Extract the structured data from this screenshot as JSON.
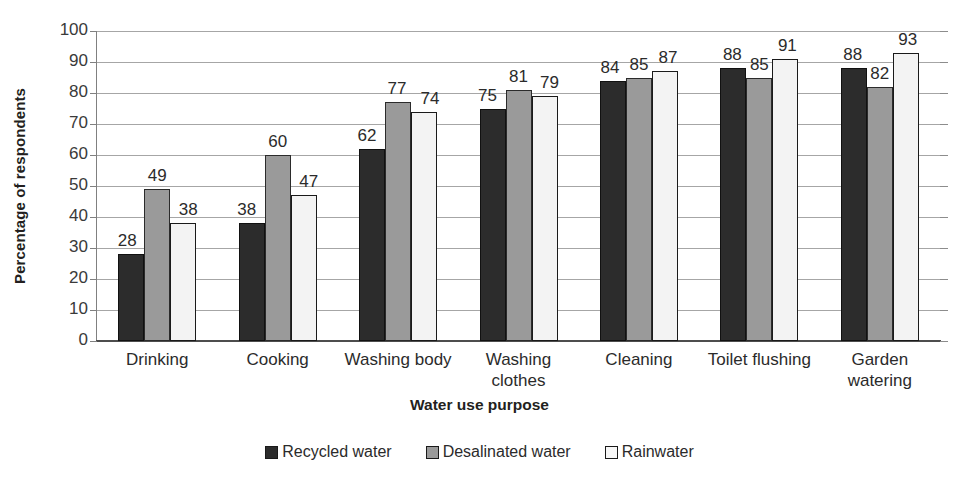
{
  "chart_data": {
    "type": "bar",
    "title": "",
    "xlabel": "Water use purpose",
    "ylabel": "Percentage of respondents",
    "ylim": [
      0,
      100
    ],
    "ytick_step": 10,
    "yticks": [
      100,
      90,
      80,
      70,
      60,
      50,
      40,
      30,
      20,
      10,
      0
    ],
    "grid": true,
    "legend_position": "bottom",
    "categories": [
      "Drinking",
      "Cooking",
      "Washing body",
      "Washing\nclothes",
      "Cleaning",
      "Toilet flushing",
      "Garden\nwatering"
    ],
    "series": [
      {
        "name": "Recycled water",
        "color": "#2c2c2c",
        "values": [
          28,
          38,
          62,
          75,
          84,
          88,
          88
        ]
      },
      {
        "name": "Desalinated water",
        "color": "#9a9a9a",
        "values": [
          49,
          60,
          77,
          81,
          85,
          85,
          82
        ]
      },
      {
        "name": "Rainwater",
        "color": "#f3f3f3",
        "values": [
          38,
          47,
          74,
          79,
          87,
          91,
          93
        ]
      }
    ]
  },
  "legend": {
    "items": [
      {
        "label": "Recycled water"
      },
      {
        "label": "Desalinated water"
      },
      {
        "label": "Rainwater"
      }
    ]
  }
}
